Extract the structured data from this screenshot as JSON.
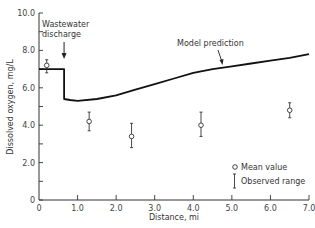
{
  "chart_data": {
    "type": "line",
    "title": "",
    "xlabel": "Distance, mi",
    "ylabel": "Dissolved oxygen, mg/L",
    "xlim": [
      0,
      7.0
    ],
    "ylim": [
      0,
      10.0
    ],
    "x_ticks": [
      "0",
      "1.0",
      "2.0",
      "3.0",
      "4.0",
      "5.0",
      "6.0",
      "7.0"
    ],
    "y_ticks": [
      "0",
      "2.0",
      "4.0",
      "6.0",
      "8.0",
      "10.0"
    ],
    "grid": false,
    "legend_position": "lower right",
    "legend": [
      {
        "symbol": "circle",
        "label": "Mean value"
      },
      {
        "symbol": "range-bar",
        "label": "Observed range"
      }
    ],
    "annotations": [
      {
        "text": "Wastewater discharge",
        "x": 0.65,
        "arrow": true
      },
      {
        "text": "Model prediction",
        "x": 4.3,
        "arrow": true
      }
    ],
    "series": [
      {
        "name": "Model prediction",
        "type": "line",
        "x": [
          0,
          0.65,
          0.65,
          0.8,
          1.0,
          1.5,
          2.0,
          2.5,
          3.0,
          3.5,
          4.0,
          4.5,
          5.0,
          5.5,
          6.0,
          6.5,
          7.0
        ],
        "y": [
          7.0,
          7.0,
          5.4,
          5.35,
          5.3,
          5.4,
          5.6,
          5.9,
          6.2,
          6.5,
          6.8,
          7.0,
          7.15,
          7.3,
          7.45,
          7.6,
          7.8
        ]
      },
      {
        "name": "Mean value",
        "type": "scatter",
        "x": [
          0.2,
          1.3,
          2.4,
          4.2,
          6.5
        ],
        "y": [
          7.2,
          4.2,
          3.4,
          4.0,
          4.8
        ],
        "range_low": [
          6.8,
          3.7,
          2.8,
          3.4,
          4.4
        ],
        "range_high": [
          7.5,
          4.7,
          4.1,
          4.7,
          5.2
        ]
      }
    ]
  }
}
